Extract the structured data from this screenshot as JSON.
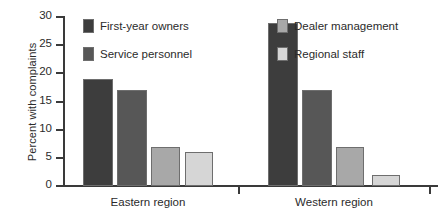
{
  "chart_data": {
    "type": "bar",
    "title": "",
    "xlabel": "",
    "ylabel": "Percent with complaints",
    "categories": [
      "Eastern region",
      "Western region"
    ],
    "series": [
      {
        "name": "First-year owners",
        "color": "#3d3d3d",
        "values": [
          19,
          29
        ]
      },
      {
        "name": "Service personnel",
        "color": "#575757",
        "values": [
          17,
          17
        ]
      },
      {
        "name": "Dealer management",
        "color": "#a8a8a8",
        "values": [
          7,
          7
        ]
      },
      {
        "name": "Regional staff",
        "color": "#d6d6d6",
        "values": [
          6,
          2
        ]
      }
    ],
    "ylim": [
      0,
      30
    ],
    "yticks": [
      0,
      5,
      10,
      15,
      20,
      25,
      30
    ],
    "ytick_labels": [
      "0",
      "5",
      "10",
      "15",
      "20",
      "25",
      "30"
    ],
    "grid": false,
    "legend_position": "inside-top"
  },
  "axis": {
    "y_title": "Percent with complaints"
  },
  "legend": {
    "items": [
      {
        "label": "First-year owners"
      },
      {
        "label": "Service personnel"
      },
      {
        "label": "Dealer management"
      },
      {
        "label": "Regional staff"
      }
    ]
  }
}
